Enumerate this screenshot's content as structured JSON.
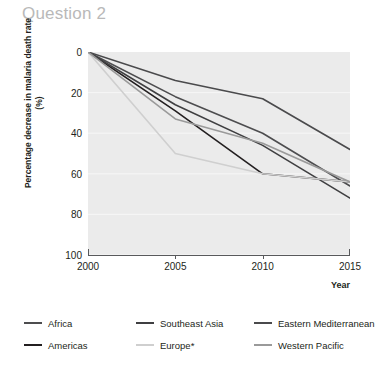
{
  "page": {
    "title": "Question 2"
  },
  "chart_data": {
    "type": "line",
    "title": "",
    "xlabel": "Year",
    "ylabel": "Percentage decrease in malaria death rate (%)",
    "x": [
      2000,
      2005,
      2010,
      2015
    ],
    "xlim": [
      2000,
      2015
    ],
    "ylim": [
      0,
      100
    ],
    "y_inverted": true,
    "xticks": [
      "2000",
      "2005",
      "2010",
      "2015"
    ],
    "yticks": [
      "0",
      "20",
      "40",
      "60",
      "80",
      "100"
    ],
    "grid": "horizontal",
    "legend_position": "below",
    "plot_background": "#ebebeb",
    "series": [
      {
        "name": "Africa",
        "color": "#4d4d4f",
        "points": [
          {
            "x": 2000,
            "y": 0
          },
          {
            "x": 2005,
            "y": 22
          },
          {
            "x": 2010,
            "y": 40
          },
          {
            "x": 2015,
            "y": 66
          }
        ]
      },
      {
        "name": "Americas",
        "color": "#231f20",
        "points": [
          {
            "x": 2000,
            "y": 0
          },
          {
            "x": 2005,
            "y": 29
          },
          {
            "x": 2010,
            "y": 60
          },
          {
            "x": 2015,
            "y": 64
          }
        ]
      },
      {
        "name": "Southeast Asia",
        "color": "#3f3f41",
        "points": [
          {
            "x": 2000,
            "y": 0
          },
          {
            "x": 2005,
            "y": 26
          },
          {
            "x": 2010,
            "y": 46
          },
          {
            "x": 2015,
            "y": 72
          }
        ]
      },
      {
        "name": "Europe*",
        "color": "#cfcfcf",
        "points": [
          {
            "x": 2000,
            "y": 0
          },
          {
            "x": 2005,
            "y": 50
          },
          {
            "x": 2010,
            "y": 60
          },
          {
            "x": 2015,
            "y": 64
          }
        ]
      },
      {
        "name": "Eastern Mediterranean",
        "color": "#4a4a4c",
        "points": [
          {
            "x": 2000,
            "y": 0
          },
          {
            "x": 2005,
            "y": 14
          },
          {
            "x": 2010,
            "y": 23
          },
          {
            "x": 2015,
            "y": 48
          }
        ]
      },
      {
        "name": "Western Pacific",
        "color": "#9a9a9a",
        "points": [
          {
            "x": 2000,
            "y": 0
          },
          {
            "x": 2005,
            "y": 33
          },
          {
            "x": 2010,
            "y": 45
          },
          {
            "x": 2015,
            "y": 64
          }
        ]
      }
    ]
  },
  "legend": {
    "items": [
      {
        "label": "Africa",
        "color": "#4d4d4f"
      },
      {
        "label": "Southeast Asia",
        "color": "#3f3f41"
      },
      {
        "label": "Eastern Mediterranean",
        "color": "#4a4a4c"
      },
      {
        "label": "Americas",
        "color": "#231f20"
      },
      {
        "label": "Europe*",
        "color": "#cfcfcf"
      },
      {
        "label": "Western Pacific",
        "color": "#9a9a9a"
      }
    ]
  }
}
